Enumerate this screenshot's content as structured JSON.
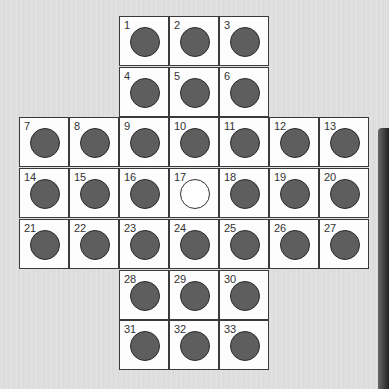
{
  "game": {
    "name": "Peg Solitaire (English cross board)",
    "cell_size_px": 50,
    "colors": {
      "peg": "#5e5e5e",
      "empty_hole": "#ffffff",
      "cell_bg": "#fdfdfd",
      "grid_line": "#3a3a3a"
    },
    "cells": [
      {
        "n": "1",
        "row": 0,
        "col": 2,
        "peg": true
      },
      {
        "n": "2",
        "row": 0,
        "col": 3,
        "peg": true
      },
      {
        "n": "3",
        "row": 0,
        "col": 4,
        "peg": true
      },
      {
        "n": "4",
        "row": 1,
        "col": 2,
        "peg": true
      },
      {
        "n": "5",
        "row": 1,
        "col": 3,
        "peg": true
      },
      {
        "n": "6",
        "row": 1,
        "col": 4,
        "peg": true
      },
      {
        "n": "7",
        "row": 2,
        "col": 0,
        "peg": true
      },
      {
        "n": "8",
        "row": 2,
        "col": 1,
        "peg": true
      },
      {
        "n": "9",
        "row": 2,
        "col": 2,
        "peg": true
      },
      {
        "n": "10",
        "row": 2,
        "col": 3,
        "peg": true
      },
      {
        "n": "11",
        "row": 2,
        "col": 4,
        "peg": true
      },
      {
        "n": "12",
        "row": 2,
        "col": 5,
        "peg": true
      },
      {
        "n": "13",
        "row": 2,
        "col": 6,
        "peg": true
      },
      {
        "n": "14",
        "row": 3,
        "col": 0,
        "peg": true
      },
      {
        "n": "15",
        "row": 3,
        "col": 1,
        "peg": true
      },
      {
        "n": "16",
        "row": 3,
        "col": 2,
        "peg": true
      },
      {
        "n": "17",
        "row": 3,
        "col": 3,
        "peg": false
      },
      {
        "n": "18",
        "row": 3,
        "col": 4,
        "peg": true
      },
      {
        "n": "19",
        "row": 3,
        "col": 5,
        "peg": true
      },
      {
        "n": "20",
        "row": 3,
        "col": 6,
        "peg": true
      },
      {
        "n": "21",
        "row": 4,
        "col": 0,
        "peg": true
      },
      {
        "n": "22",
        "row": 4,
        "col": 1,
        "peg": true
      },
      {
        "n": "23",
        "row": 4,
        "col": 2,
        "peg": true
      },
      {
        "n": "24",
        "row": 4,
        "col": 3,
        "peg": true
      },
      {
        "n": "25",
        "row": 4,
        "col": 4,
        "peg": true
      },
      {
        "n": "26",
        "row": 4,
        "col": 5,
        "peg": true
      },
      {
        "n": "27",
        "row": 4,
        "col": 6,
        "peg": true
      },
      {
        "n": "28",
        "row": 5,
        "col": 2,
        "peg": true
      },
      {
        "n": "29",
        "row": 5,
        "col": 3,
        "peg": true
      },
      {
        "n": "30",
        "row": 5,
        "col": 4,
        "peg": true
      },
      {
        "n": "31",
        "row": 6,
        "col": 2,
        "peg": true
      },
      {
        "n": "32",
        "row": 6,
        "col": 3,
        "peg": true
      },
      {
        "n": "33",
        "row": 6,
        "col": 4,
        "peg": true
      }
    ]
  }
}
